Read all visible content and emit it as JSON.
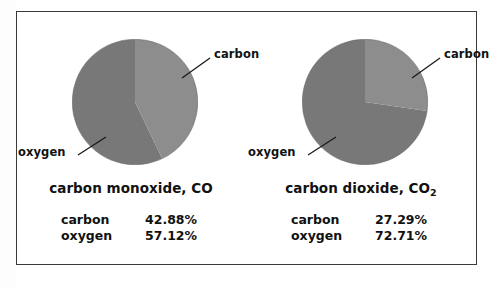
{
  "figure": {
    "background_color": "#ffffff",
    "border_color": "#3a3a3a",
    "slice_carbon_color": "#8d8d8d",
    "slice_oxygen_color": "#787878",
    "text_color": "#111111"
  },
  "panels": [
    {
      "id": "carbon-monoxide",
      "caption_main": "carbon monoxide, CO",
      "caption_formula_base": "",
      "caption_formula_sub": "",
      "callout_carbon": "carbon",
      "callout_oxygen": "oxygen",
      "legend": [
        {
          "name": "carbon",
          "value": "42.88%"
        },
        {
          "name": "oxygen",
          "value": "57.12%"
        }
      ]
    },
    {
      "id": "carbon-dioxide",
      "caption_main": "carbon dioxide, CO",
      "caption_formula_base": "CO",
      "caption_formula_sub": "2",
      "callout_carbon": "carbon",
      "callout_oxygen": "oxygen",
      "legend": [
        {
          "name": "carbon",
          "value": "27.29%"
        },
        {
          "name": "oxygen",
          "value": "72.71%"
        }
      ]
    }
  ],
  "chart_data": [
    {
      "type": "pie",
      "title": "carbon monoxide, CO",
      "labels": [
        "carbon",
        "oxygen"
      ],
      "values": [
        42.88,
        57.12
      ],
      "value_labels": [
        "42.88%",
        "57.12%"
      ],
      "units": "percent by mass",
      "colors": [
        "#8d8d8d",
        "#787878"
      ],
      "start_angle_deg": 0,
      "direction": "clockwise",
      "legend": "below-chart",
      "grid": false,
      "annotations": [
        {
          "text": "carbon",
          "points_to": "carbon"
        },
        {
          "text": "oxygen",
          "points_to": "oxygen"
        }
      ]
    },
    {
      "type": "pie",
      "title": "carbon dioxide, CO2",
      "labels": [
        "carbon",
        "oxygen"
      ],
      "values": [
        27.29,
        72.71
      ],
      "value_labels": [
        "27.29%",
        "72.71%"
      ],
      "units": "percent by mass",
      "colors": [
        "#8d8d8d",
        "#787878"
      ],
      "start_angle_deg": 0,
      "direction": "clockwise",
      "legend": "below-chart",
      "grid": false,
      "annotations": [
        {
          "text": "carbon",
          "points_to": "carbon"
        },
        {
          "text": "oxygen",
          "points_to": "oxygen"
        }
      ]
    }
  ]
}
